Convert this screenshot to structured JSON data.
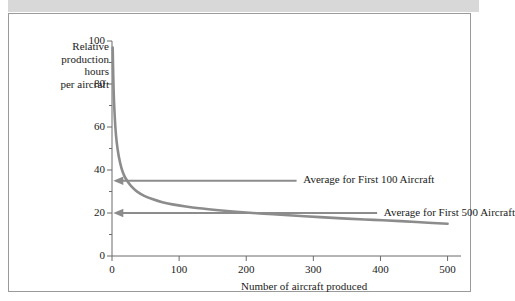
{
  "figure": {
    "background_color": "#ffffff",
    "border_color": "#9a9a9a",
    "top_band_color": "#d8d8d8"
  },
  "chart_data": {
    "type": "line",
    "title": "",
    "xlabel": "Number of aircraft produced",
    "ylabel": "Relative production hours per aircraft",
    "ylabel_lines": [
      "Relative",
      "production",
      "hours",
      "per aircraft"
    ],
    "xlim": [
      0,
      520
    ],
    "ylim": [
      0,
      100
    ],
    "xticks": [
      0,
      100,
      200,
      300,
      400,
      500
    ],
    "xtick_labels": [
      "0",
      "100",
      "200",
      "300",
      "400",
      "500"
    ],
    "yticks": [
      0,
      20,
      40,
      60,
      80,
      100
    ],
    "ytick_labels": [
      "0",
      "20",
      "40",
      "60",
      "80",
      "100"
    ],
    "y_minor_ticks": [
      10,
      30,
      50,
      70,
      90
    ],
    "grid": false,
    "legend": "none",
    "series": [
      {
        "name": "Learning curve",
        "color": "#8c8c8c",
        "line_width": 2.6,
        "x": [
          1,
          2,
          3,
          5,
          7,
          10,
          14,
          18,
          23,
          30,
          38,
          48,
          60,
          75,
          90,
          110,
          130,
          155,
          180,
          210,
          240,
          275,
          310,
          350,
          390,
          430,
          465,
          500
        ],
        "values": [
          97,
          82,
          72,
          60,
          53,
          46.5,
          41,
          37.5,
          34.8,
          32,
          29.8,
          28,
          26.5,
          25,
          24,
          23,
          22.2,
          21.4,
          20.7,
          20,
          19.4,
          18.7,
          18.1,
          17.4,
          16.8,
          16.2,
          15.6,
          15
        ]
      }
    ],
    "annotations": [
      {
        "label": "Average for First 100 Aircraft",
        "y_value": 35,
        "arrow_from_x": 275,
        "arrow_to_x": 2,
        "text_x": 285,
        "color": "#8c8c8c"
      },
      {
        "label": "Average for First 500 Aircraft",
        "y_value": 20,
        "arrow_from_x": 395,
        "arrow_to_x": 2,
        "text_x": 405,
        "color": "#8c8c8c"
      }
    ],
    "axis_color": "#6b6b6b"
  }
}
